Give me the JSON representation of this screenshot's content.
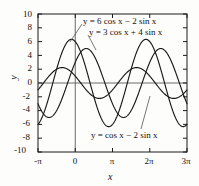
{
  "figure": {
    "name": "trigonometric-sinusoid-plot",
    "background_color": "#fdfdfc",
    "ink_color": "#1a1a1a"
  },
  "axes": {
    "x_name": "x",
    "y_name": "y",
    "x_ticks": [
      "-π",
      "0",
      "π",
      "2π",
      "3π"
    ],
    "y_ticks": [
      "10",
      "8",
      "6",
      "4",
      "2",
      "0",
      "-2",
      "-4",
      "-6",
      "-8",
      "-10"
    ]
  },
  "labels": {
    "curve_a": "y = 6 cos x − 2 sin x",
    "curve_b": "y = 3 cos x + 4 sin x",
    "curve_c": "y = cos x − 2 sin x"
  },
  "chart_data": {
    "type": "line",
    "title": "",
    "xlabel": "x",
    "ylabel": "y",
    "xlim": [
      -3.141592653589793,
      9.42477796076938
    ],
    "ylim": [
      -10,
      10
    ],
    "x_tick_values": [
      -3.141592653589793,
      0,
      3.141592653589793,
      6.283185307179586,
      9.42477796076938
    ],
    "x_tick_labels": [
      "-π",
      "0",
      "π",
      "2π",
      "3π"
    ],
    "y_tick_values": [
      10,
      8,
      6,
      4,
      2,
      0,
      -2,
      -4,
      -6,
      -8,
      -10
    ],
    "y_tick_labels": [
      "10",
      "8",
      "6",
      "4",
      "2",
      "0",
      "-2",
      "-4",
      "-6",
      "-8",
      "-10"
    ],
    "grid": false,
    "legend": "inline-annotations",
    "series": [
      {
        "name": "y = 6 cos x − 2 sin x",
        "cos_coefficient": 6,
        "sin_coefficient": -2,
        "amplitude": 6.324555320336759,
        "phase_shift": 0.3217505543966422,
        "period": 6.283185307179586,
        "value_at_zero": 6,
        "value_at_minus_pi": -6,
        "color": "#1a1a1a"
      },
      {
        "name": "y = 3 cos x + 4 sin x",
        "cos_coefficient": 3,
        "sin_coefficient": 4,
        "amplitude": 5,
        "phase_shift": -0.9272952180016122,
        "period": 6.283185307179586,
        "value_at_zero": 3,
        "value_at_minus_pi": -3,
        "color": "#1a1a1a"
      },
      {
        "name": "y = cos x − 2 sin x",
        "cos_coefficient": 1,
        "sin_coefficient": -2,
        "amplitude": 2.23606797749979,
        "phase_shift": 1.1071487177940904,
        "period": 6.283185307179586,
        "value_at_zero": 1,
        "value_at_minus_pi": -1,
        "color": "#1a1a1a"
      }
    ]
  }
}
